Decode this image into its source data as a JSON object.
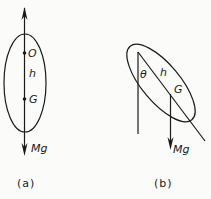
{
  "figure_a": {
    "caption": "(a)",
    "labels": {
      "pivot": "O",
      "distance": "h",
      "center_of_mass": "G",
      "force": "Mg"
    }
  },
  "figure_b": {
    "caption": "(b)",
    "labels": {
      "angle": "θ",
      "distance": "h",
      "center_of_mass": "G",
      "force": "Mg"
    }
  },
  "colors": {
    "ink": "#1a1a1a",
    "background": "#fbfbf9"
  }
}
